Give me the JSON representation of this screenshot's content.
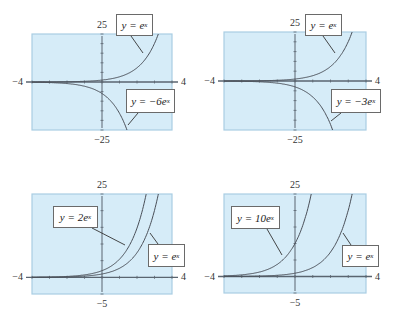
{
  "colors": {
    "panel_fill": "#d6ecf8",
    "panel_border": "#a9cde3",
    "axis": "#5a6570",
    "curve": "#4a4f58",
    "label_border": "#6a6a6a"
  },
  "chart_data": [
    {
      "type": "line",
      "title": "",
      "xlabel": "",
      "ylabel": "",
      "xlim": [
        -4,
        4
      ],
      "ylim": [
        -25,
        25
      ],
      "tick_labels": {
        "x_min": "−4",
        "x_max": "4",
        "y_min": "−25",
        "y_max": "25"
      },
      "grid": false,
      "series": [
        {
          "name": "y = e^x",
          "coef": 1,
          "label": "y = e",
          "exp": "x"
        },
        {
          "name": "y = −6e^x",
          "coef": -6,
          "label": "y = −6e",
          "exp": "x"
        }
      ],
      "box": {
        "x": 32,
        "y": 34,
        "w": 140,
        "h": 96
      },
      "labels": [
        {
          "series": 0,
          "x": 116,
          "y": 14,
          "w": 37,
          "h": 22,
          "leader": [
            [
              131,
              36
            ],
            [
              143,
              53
            ]
          ]
        },
        {
          "series": 1,
          "x": 126,
          "y": 89,
          "w": 49,
          "h": 24,
          "leader": [
            [
              138,
              113
            ],
            [
              128,
              125
            ]
          ]
        }
      ]
    },
    {
      "type": "line",
      "title": "",
      "xlabel": "",
      "ylabel": "",
      "xlim": [
        -4,
        4
      ],
      "ylim": [
        -25,
        25
      ],
      "tick_labels": {
        "x_min": "−4",
        "x_max": "4",
        "y_min": "−25",
        "y_max": "25"
      },
      "grid": false,
      "series": [
        {
          "name": "y = e^x",
          "coef": 1,
          "label": "y = e",
          "exp": "x"
        },
        {
          "name": "y = −3e^x",
          "coef": -3,
          "label": "y = −3e",
          "exp": "x"
        }
      ],
      "box": {
        "x": 224,
        "y": 32,
        "w": 142,
        "h": 98
      },
      "labels": [
        {
          "series": 0,
          "x": 305,
          "y": 14,
          "w": 37,
          "h": 22,
          "leader": [
            [
              323,
              36
            ],
            [
              335,
              53
            ]
          ]
        },
        {
          "series": 1,
          "x": 331,
          "y": 89,
          "w": 50,
          "h": 24,
          "leader": [
            [
              341,
              113
            ],
            [
              331,
              121
            ]
          ]
        }
      ]
    },
    {
      "type": "line",
      "title": "",
      "xlabel": "",
      "ylabel": "",
      "xlim": [
        -4,
        4
      ],
      "ylim": [
        -5,
        25
      ],
      "tick_labels": {
        "x_min": "−4",
        "x_max": "4",
        "y_min": "−5",
        "y_max": "25"
      },
      "grid": false,
      "series": [
        {
          "name": "y = 2e^x",
          "coef": 2,
          "label": "y = 2e",
          "exp": "x"
        },
        {
          "name": "y = e^x",
          "coef": 1,
          "label": "y = e",
          "exp": "x"
        }
      ],
      "box": {
        "x": 32,
        "y": 194,
        "w": 140,
        "h": 100
      },
      "labels": [
        {
          "series": 0,
          "x": 53,
          "y": 206,
          "w": 45,
          "h": 22,
          "leader": [
            [
              92,
              228
            ],
            [
              125,
              245
            ]
          ]
        },
        {
          "series": 1,
          "x": 148,
          "y": 244,
          "w": 37,
          "h": 23,
          "leader": [
            [
              158,
              244
            ],
            [
              150,
              233
            ]
          ]
        }
      ]
    },
    {
      "type": "line",
      "title": "",
      "xlabel": "",
      "ylabel": "",
      "xlim": [
        -4,
        4
      ],
      "ylim": [
        -5,
        25
      ],
      "tick_labels": {
        "x_min": "−4",
        "x_max": "4",
        "y_min": "−5",
        "y_max": "25"
      },
      "grid": false,
      "series": [
        {
          "name": "y = 10e^x",
          "coef": 10,
          "label": "y = 10e",
          "exp": "x"
        },
        {
          "name": "y = e^x",
          "coef": 1,
          "label": "y = e",
          "exp": "x"
        }
      ],
      "box": {
        "x": 224,
        "y": 194,
        "w": 142,
        "h": 99
      },
      "labels": [
        {
          "series": 0,
          "x": 231,
          "y": 206,
          "w": 49,
          "h": 23,
          "leader": [
            [
              267,
              229
            ],
            [
              282,
              255
            ]
          ]
        },
        {
          "series": 1,
          "x": 342,
          "y": 245,
          "w": 37,
          "h": 22,
          "leader": [
            [
              351,
              245
            ],
            [
              343,
              233
            ]
          ]
        }
      ]
    }
  ]
}
